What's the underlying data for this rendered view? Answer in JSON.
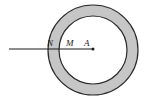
{
  "figure": {
    "type": "geometry-diagram",
    "background_color": "#ffffff",
    "canvas": {
      "width": 147,
      "height": 102
    },
    "annulus": {
      "name": "annulus",
      "center_x": 93,
      "center_y": 50,
      "outer_radius": 45,
      "inner_radius": 34,
      "band_fill_color": "#c6c6c6",
      "stroke_color": "#2b2b2b",
      "inner_fill_color": "#ffffff",
      "stroke_width": 1.2
    },
    "line": {
      "name": "horizontal-line",
      "x_start": 9,
      "x_end": 93,
      "y": 49,
      "color": "#1a1a1a",
      "width": 1.1
    },
    "point_marker": {
      "name": "point-a-dot",
      "x": 93,
      "y": 49,
      "radius": 1.5,
      "color": "#1a1a1a"
    },
    "labels": [
      {
        "id": "label-n",
        "text": "N",
        "x": 47,
        "y": 46
      },
      {
        "id": "label-m",
        "text": "M",
        "x": 66,
        "y": 46
      },
      {
        "id": "label-a",
        "text": "A",
        "x": 84,
        "y": 46
      }
    ]
  }
}
